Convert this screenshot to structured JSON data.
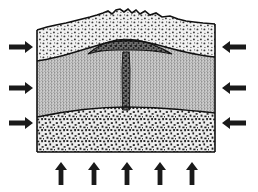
{
  "figure": {
    "type": "geologic-cross-section",
    "background_color": "#ffffff",
    "line_color": "#111111"
  },
  "block": {
    "left_x": 37,
    "right_x": 215,
    "bottom_y": 152,
    "top_y": 22,
    "outline_color": "#111111"
  },
  "layers": [
    {
      "name": "upper-sedimentary-layer",
      "label": "upper stippled sedimentary layer",
      "pattern": "coarse-stipple",
      "fill_color": "#f2f2f2",
      "dot_color": "#3a3a3a",
      "top_surface": "irregular-eroded-mountainous",
      "top_y_left": 30,
      "top_y_peak": 9,
      "bottom_y_left": 61,
      "bottom_y_center": 41
    },
    {
      "name": "middle-stratified-layer",
      "label": "middle fine-dotted stratified layer",
      "pattern": "fine-dot-grid",
      "fill_color": "#c9c9c9",
      "dot_color": "#444444",
      "top_y_left": 61,
      "bottom_y_left": 117,
      "bottom_y_center": 108
    },
    {
      "name": "lower-basement-layer",
      "label": "lower coarse crystalline basement layer",
      "pattern": "coarse-random-speckle",
      "fill_color": "#ededed",
      "dot_color": "#222222",
      "top_y_left": 117,
      "bottom_y": 152
    }
  ],
  "intrusion": {
    "name": "laccolith",
    "label": "mushroom-shaped igneous intrusion",
    "fill_color": "#5a5a5a",
    "dark_speckle_color": "#1c1c1c",
    "cap_left_x": 88,
    "cap_right_x": 172,
    "cap_top_y": 40,
    "cap_bottom_y": 54,
    "dike": {
      "name": "feeder-dike",
      "label": "vertical feeder dike",
      "left_x": 122,
      "right_x": 130,
      "top_y": 48,
      "bottom_y": 110,
      "fill_color": "#5a5a5a"
    }
  },
  "stress_arrows": {
    "left": {
      "name": "left-compression-arrows",
      "direction": "right",
      "count": 3,
      "color": "#1a1a1a",
      "items": [
        {
          "tip_x": 33,
          "tail_x": 9,
          "y": 47
        },
        {
          "tip_x": 33,
          "tail_x": 9,
          "y": 88
        },
        {
          "tip_x": 33,
          "tail_x": 9,
          "y": 123
        }
      ]
    },
    "right": {
      "name": "right-compression-arrows",
      "direction": "left",
      "count": 3,
      "color": "#1a1a1a",
      "items": [
        {
          "tip_x": 220,
          "tail_x": 246,
          "y": 47
        },
        {
          "tip_x": 220,
          "tail_x": 246,
          "y": 88
        },
        {
          "tip_x": 220,
          "tail_x": 246,
          "y": 123
        }
      ]
    },
    "bottom": {
      "name": "bottom-uplift-arrows",
      "direction": "up",
      "count": 5,
      "color": "#1a1a1a",
      "items": [
        {
          "x": 61,
          "tip_y": 162,
          "tail_y": 186
        },
        {
          "x": 94,
          "tip_y": 162,
          "tail_y": 186
        },
        {
          "x": 127,
          "tip_y": 162,
          "tail_y": 186
        },
        {
          "x": 160,
          "tip_y": 162,
          "tail_y": 186
        },
        {
          "x": 192,
          "tip_y": 162,
          "tail_y": 186
        }
      ]
    }
  }
}
